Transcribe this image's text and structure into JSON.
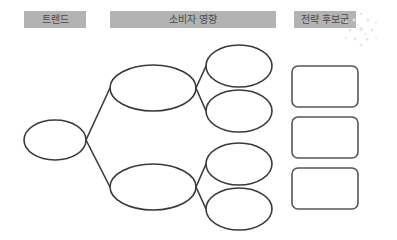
{
  "headers": {
    "trend": "트렌드",
    "consumer_impact": "소비자 영향",
    "strategy_candidates": "전략 후보군"
  },
  "colors": {
    "header_bg": "#b3b3b3",
    "header_text": "#4a4a4a",
    "stroke": "#3a3a3a",
    "box_stroke": "#555555"
  },
  "diagram": {
    "root": {
      "label": ""
    },
    "level1": [
      {
        "label": ""
      },
      {
        "label": ""
      }
    ],
    "level2": [
      {
        "label": ""
      },
      {
        "label": ""
      },
      {
        "label": ""
      },
      {
        "label": ""
      }
    ],
    "strategy_boxes": [
      {
        "label": ""
      },
      {
        "label": ""
      },
      {
        "label": ""
      }
    ]
  }
}
